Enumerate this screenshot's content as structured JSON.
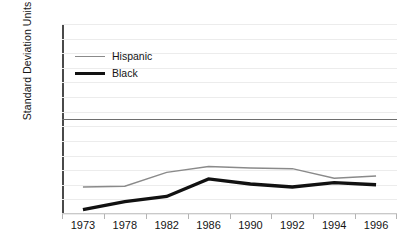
{
  "chart_data": {
    "type": "line",
    "title": "",
    "xlabel": "",
    "ylabel": "Standard Deviation Units",
    "categories": [
      "1973",
      "1978",
      "1982",
      "1986",
      "1990",
      "1992",
      "1994",
      "1996"
    ],
    "ylim": [
      -1.3,
      1.3
    ],
    "ytick_labels": [
      "1.3",
      "1.1",
      "0.9",
      "0.7",
      "0.5",
      "0.3",
      "0.1",
      "-0.1",
      "-0.3",
      "-0.5",
      "-0.7",
      "-0.9",
      "-1.1",
      "-1.3"
    ],
    "ytick_values": [
      1.3,
      1.1,
      0.9,
      0.7,
      0.5,
      0.3,
      0.1,
      -0.1,
      -0.3,
      -0.5,
      -0.7,
      -0.9,
      -1.1,
      -1.3
    ],
    "grid": true,
    "zero_reference_line": 0.0,
    "legend_position": "upper-left-inside",
    "series": [
      {
        "name": "Hispanic",
        "color": "#8a8a8a",
        "line_width": 1.4,
        "values": [
          -0.93,
          -0.92,
          -0.73,
          -0.65,
          -0.67,
          -0.68,
          -0.81,
          -0.78
        ]
      },
      {
        "name": "Black",
        "color": "#111111",
        "line_width": 3.4,
        "values": [
          -1.24,
          -1.13,
          -1.06,
          -0.82,
          -0.89,
          -0.93,
          -0.87,
          -0.9
        ]
      }
    ]
  },
  "legend": {
    "items": [
      {
        "label": "Hispanic",
        "swatch": "thin-gray-line"
      },
      {
        "label": "Black",
        "swatch": "thick-black-line"
      }
    ]
  },
  "colors": {
    "hispanic": "#8a8a8a",
    "black": "#111111",
    "axis": "#4a4a4a",
    "gridline": "#ececec",
    "zero_line": "#6e6e6e",
    "background": "#ffffff"
  }
}
